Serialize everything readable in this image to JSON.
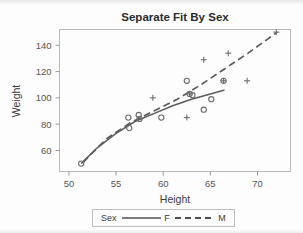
{
  "chart_data": {
    "type": "scatter",
    "title": "Separate Fit By Sex",
    "xlabel": "Height",
    "ylabel": "Weight",
    "xlim": [
      49.0,
      73.5
    ],
    "ylim": [
      44,
      152
    ],
    "xticks": [
      50,
      55,
      60,
      65,
      70
    ],
    "yticks": [
      60,
      80,
      100,
      120,
      140
    ],
    "xtick_labels": [
      "50",
      "55",
      "60",
      "65",
      "70"
    ],
    "ytick_labels": [
      "60",
      "80",
      "100",
      "120",
      "140"
    ],
    "grid": false,
    "legend": {
      "title": "Sex",
      "position": "bottom",
      "entries": [
        {
          "label": "F",
          "style": "solid",
          "marker": "circle"
        },
        {
          "label": "M",
          "style": "dashed",
          "marker": "plus"
        }
      ]
    },
    "series": [
      {
        "name": "F",
        "marker": "circle",
        "line_style": "solid",
        "points": [
          {
            "x": 51.3,
            "y": 50
          },
          {
            "x": 56.3,
            "y": 85
          },
          {
            "x": 56.4,
            "y": 77
          },
          {
            "x": 57.5,
            "y": 84
          },
          {
            "x": 57.4,
            "y": 87
          },
          {
            "x": 59.8,
            "y": 85
          },
          {
            "x": 62.5,
            "y": 113
          },
          {
            "x": 62.8,
            "y": 103
          },
          {
            "x": 63.1,
            "y": 102
          },
          {
            "x": 64.3,
            "y": 91
          },
          {
            "x": 65.1,
            "y": 99
          },
          {
            "x": 66.4,
            "y": 113
          }
        ],
        "fit_curve": [
          {
            "x": 51.3,
            "y": 50
          },
          {
            "x": 53.0,
            "y": 62
          },
          {
            "x": 55.0,
            "y": 73
          },
          {
            "x": 57.0,
            "y": 82
          },
          {
            "x": 59.0,
            "y": 88
          },
          {
            "x": 61.0,
            "y": 94
          },
          {
            "x": 63.0,
            "y": 99
          },
          {
            "x": 65.0,
            "y": 103
          },
          {
            "x": 66.5,
            "y": 106
          }
        ]
      },
      {
        "name": "M",
        "marker": "plus",
        "line_style": "dashed",
        "points": [
          {
            "x": 58.9,
            "y": 100
          },
          {
            "x": 62.5,
            "y": 85
          },
          {
            "x": 62.8,
            "y": 103
          },
          {
            "x": 64.3,
            "y": 129
          },
          {
            "x": 66.4,
            "y": 113
          },
          {
            "x": 66.9,
            "y": 134
          },
          {
            "x": 68.9,
            "y": 113
          },
          {
            "x": 72.0,
            "y": 150
          }
        ],
        "fit_curve": [
          {
            "x": 51.5,
            "y": 51
          },
          {
            "x": 54.0,
            "y": 69
          },
          {
            "x": 56.5,
            "y": 81
          },
          {
            "x": 59.0,
            "y": 90
          },
          {
            "x": 61.5,
            "y": 99
          },
          {
            "x": 64.0,
            "y": 110
          },
          {
            "x": 66.5,
            "y": 122
          },
          {
            "x": 69.0,
            "y": 134
          },
          {
            "x": 72.1,
            "y": 150
          }
        ]
      }
    ]
  }
}
